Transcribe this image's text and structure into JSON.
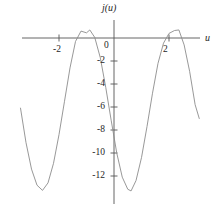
{
  "figure": {
    "axis_label_y": "j(u)",
    "axis_label_x": "u",
    "origin_label": "0"
  },
  "chart_data": {
    "type": "line",
    "title": "",
    "xlabel": "u",
    "ylabel": "j(u)",
    "xlim": [
      -3.4,
      3.1
    ],
    "ylim": [
      -13.5,
      1.2
    ],
    "xticks": [
      -2,
      2
    ],
    "xticklabels": [
      "-2",
      "2"
    ],
    "yticks": [
      -2,
      -4,
      -6,
      -8,
      -10,
      -12
    ],
    "yticklabels": [
      "-2",
      "-4",
      "-6",
      "-8",
      "-10",
      "-12"
    ],
    "grid": false,
    "legend": null,
    "origin_label": "0",
    "curve_color": "#8c8c8c",
    "axis_color": "#555555",
    "series": [
      {
        "name": "j(u)",
        "expression": "-6.3 + 7.0*cos(2.30*(u + 0.88))",
        "x": [
          -3.4,
          -3.2,
          -3.0,
          -2.8,
          -2.6,
          -2.4,
          -2.2,
          -2.0,
          -1.8,
          -1.6,
          -1.4,
          -1.2,
          -1.0,
          -0.88,
          -0.7,
          -0.5,
          -0.3,
          -0.1,
          0.1,
          0.3,
          0.5,
          0.62,
          0.8,
          1.0,
          1.2,
          1.4,
          1.6,
          1.8,
          2.0,
          2.2,
          2.36,
          2.55,
          2.75,
          2.95,
          3.1
        ],
        "y": [
          -6.1,
          -9.1,
          -11.4,
          -12.8,
          -13.25,
          -12.6,
          -10.9,
          -8.4,
          -5.5,
          -2.6,
          -0.3,
          0.6,
          0.45,
          0.7,
          0.05,
          -1.7,
          -4.3,
          -7.2,
          -10.0,
          -12.1,
          -13.15,
          -13.3,
          -12.4,
          -10.4,
          -7.7,
          -4.8,
          -2.2,
          -0.45,
          0.4,
          0.65,
          0.7,
          -0.6,
          -2.9,
          -5.8,
          -7.0
        ]
      }
    ],
    "features": {
      "peaks_u": [
        -0.88,
        2.36
      ],
      "peak_value": 0.7,
      "troughs_u": [
        -2.6,
        0.62
      ],
      "trough_value": -13.3
    }
  }
}
